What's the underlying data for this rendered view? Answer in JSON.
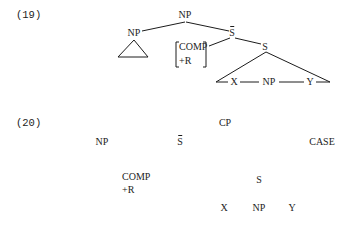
{
  "example_19": {
    "number": "(19)",
    "nodes": {
      "root": "NP",
      "left_np": "NP",
      "sbar": "S",
      "comp_line1": "COMP",
      "comp_line2": "+R",
      "s": "S",
      "x": "X",
      "np_inner": "NP",
      "y": "Y"
    }
  },
  "example_20": {
    "number": "(20)",
    "nodes": {
      "cp": "CP",
      "np": "NP",
      "sbar": "S",
      "case": "CASE",
      "comp_line1": "COMP",
      "comp_line2": "+R",
      "s": "S",
      "x": "X",
      "np_inner": "NP",
      "y": "Y"
    }
  }
}
